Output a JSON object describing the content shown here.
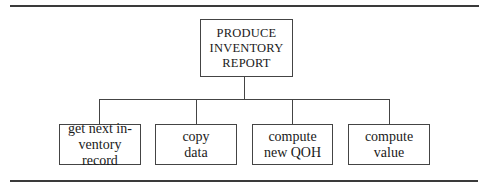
{
  "diagram": {
    "type": "hierarchy-chart",
    "root": {
      "label": "PRODUCE\nINVENTORY\nREPORT"
    },
    "children": [
      {
        "label": "get next in-\nventory record"
      },
      {
        "label": "copy\ndata"
      },
      {
        "label": "compute\nnew QOH"
      },
      {
        "label": "compute\nvalue"
      }
    ],
    "colors": {
      "line": "#444444",
      "rule": "#3a3a3a",
      "background": "#ffffff",
      "text": "#1a1a1a"
    }
  }
}
